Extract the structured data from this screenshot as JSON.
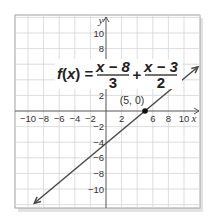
{
  "chart_data": {
    "type": "line",
    "title": "",
    "equation": {
      "lhs": "f(x) =",
      "term1_num": "x − 8",
      "term1_den": "3",
      "op": "+",
      "term2_num": "x − 3",
      "term2_den": "2"
    },
    "xlabel": "x",
    "ylabel": "y",
    "xlim": [
      -11.7,
      12.0
    ],
    "ylim": [
      -12.4,
      12.2
    ],
    "grid": true,
    "grid_step": 2,
    "x_tick_labels": [
      "−10",
      "−8",
      "−6",
      "−4",
      "−2",
      "2",
      "6",
      "8",
      "10"
    ],
    "x_tick_values": [
      -10,
      -8,
      -6,
      -4,
      -2,
      2,
      6,
      8,
      10
    ],
    "y_tick_labels": [
      "10",
      "8",
      "2",
      "−2",
      "−4",
      "−6",
      "−8",
      "−10"
    ],
    "y_tick_values": [
      10,
      8,
      2,
      -2,
      -4,
      -6,
      -8,
      -10
    ],
    "series": [
      {
        "name": "f(x) = (x − 8)/3 + (x − 3)/2",
        "slope": 0.8333,
        "intercept": -4.1667,
        "x": [
          -9.2,
          11.8
        ],
        "y": [
          -11.83,
          5.67
        ],
        "arrows": "both"
      }
    ],
    "points": [
      {
        "x": 5,
        "y": 0,
        "label": "(5, 0)"
      }
    ]
  },
  "colors": {
    "grid": "#d4d4d4",
    "axis": "#555555",
    "line": "#4a4a4a",
    "border": "#9a9a9a",
    "shadow": "#dcdcdc"
  }
}
